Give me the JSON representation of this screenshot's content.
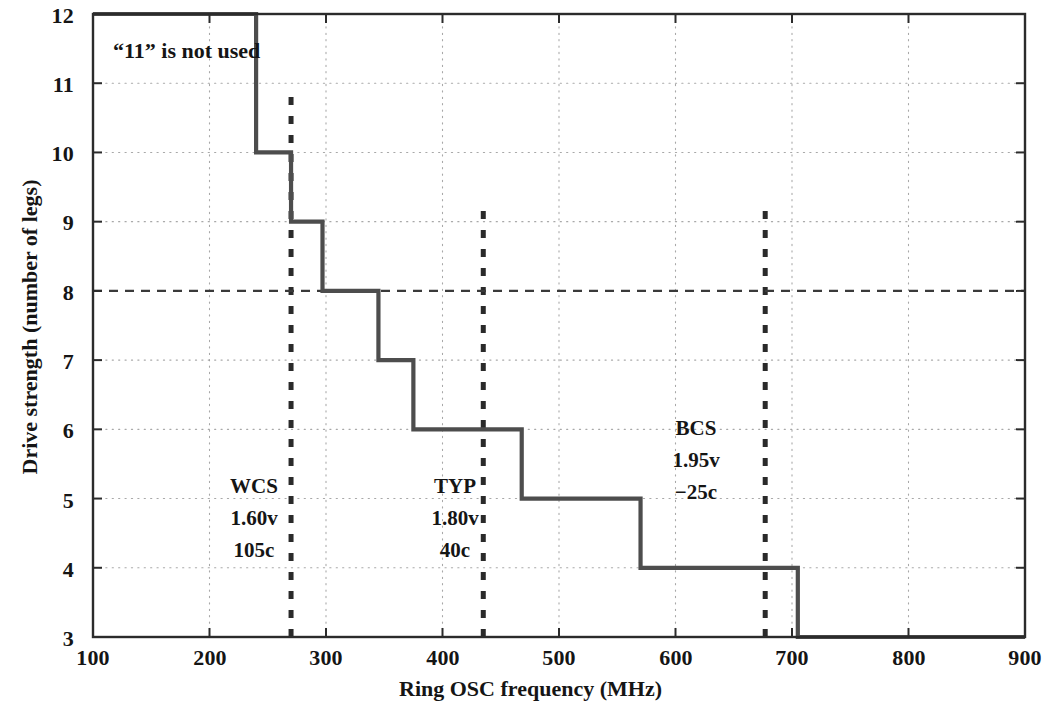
{
  "chart_data": {
    "type": "line",
    "subtype": "step-post",
    "title": "",
    "xlabel": "Ring OSC frequency (MHz)",
    "ylabel": "Drive strength (number of legs)",
    "xlim": [
      100,
      900
    ],
    "ylim": [
      3,
      12
    ],
    "xticks": [
      100,
      200,
      300,
      400,
      500,
      600,
      700,
      800,
      900
    ],
    "yticks": [
      3,
      4,
      5,
      6,
      7,
      8,
      9,
      10,
      11,
      12
    ],
    "grid": "dotted-both",
    "legend": "none",
    "series": [
      {
        "name": "Drive strength selection",
        "color": "#4d4d4d",
        "x": [
          100,
          240,
          240,
          270,
          270,
          297,
          297,
          345,
          345,
          375,
          375,
          468,
          468,
          570,
          570,
          705,
          705,
          900
        ],
        "y": [
          12,
          12,
          10,
          10,
          9,
          9,
          8,
          8,
          7,
          7,
          6,
          6,
          5,
          5,
          4,
          4,
          3,
          3
        ],
        "steps": [
          {
            "frequency_mhz": 240,
            "from_legs": 12,
            "to_legs": 10
          },
          {
            "frequency_mhz": 270,
            "from_legs": 10,
            "to_legs": 9
          },
          {
            "frequency_mhz": 297,
            "from_legs": 9,
            "to_legs": 8
          },
          {
            "frequency_mhz": 345,
            "from_legs": 8,
            "to_legs": 7
          },
          {
            "frequency_mhz": 375,
            "from_legs": 7,
            "to_legs": 6
          },
          {
            "frequency_mhz": 468,
            "from_legs": 6,
            "to_legs": 5
          },
          {
            "frequency_mhz": 570,
            "from_legs": 5,
            "to_legs": 4
          },
          {
            "frequency_mhz": 705,
            "from_legs": 4,
            "to_legs": 3
          }
        ]
      }
    ],
    "reference_lines": [
      {
        "name": "WCS",
        "orientation": "vertical",
        "x": 270,
        "y_from": 3.0,
        "y_to": 10.85,
        "style": "dashed",
        "color": "#2a2a2a"
      },
      {
        "name": "TYP",
        "orientation": "vertical",
        "x": 435,
        "y_from": 3.0,
        "y_to": 9.3,
        "style": "dashed",
        "color": "#2a2a2a"
      },
      {
        "name": "BCS",
        "orientation": "vertical",
        "x": 677,
        "y_from": 3.0,
        "y_to": 9.3,
        "style": "dashed",
        "color": "#2a2a2a"
      },
      {
        "name": "legs-8-highlight",
        "orientation": "horizontal",
        "y": 8,
        "x_from": 100,
        "x_to": 900,
        "style": "dashed",
        "color": "#3a3a3a"
      }
    ],
    "annotations": [
      {
        "name": "note-11-not-used",
        "text": "“11” is not used",
        "x": 130,
        "y": 11.55
      },
      {
        "name": "wcs-corner",
        "lines": [
          "WCS",
          "1.60v",
          "105c"
        ],
        "x": 236,
        "y": 5.1
      },
      {
        "name": "typ-corner",
        "lines": [
          "TYP",
          "1.80v",
          "40c"
        ],
        "x": 400,
        "y": 5.1
      },
      {
        "name": "bcs-corner",
        "lines": [
          "BCS",
          "1.95v",
          "-25c"
        ],
        "x": 640,
        "y": 6.15
      }
    ]
  },
  "axes": {
    "y_tick_labels": [
      "12",
      "11",
      "10",
      "9",
      "8",
      "7",
      "6",
      "5",
      "4",
      "3"
    ],
    "x_tick_labels": [
      "100",
      "200",
      "300",
      "400",
      "500",
      "600",
      "700",
      "800",
      "900"
    ],
    "x_title": "Ring OSC frequency (MHz)",
    "y_title": "Drive strength (number of legs)"
  },
  "notes": {
    "eleven_not_used": "“11” is not used"
  },
  "corners": {
    "wcs": {
      "name": "WCS",
      "voltage": "1.60v",
      "temperature": "105c"
    },
    "typ": {
      "name": "TYP",
      "voltage": "1.80v",
      "temperature": "40c"
    },
    "bcs": {
      "name": "BCS",
      "voltage": "1.95v",
      "temperature": "−25c"
    }
  },
  "colors": {
    "background": "#ffffff",
    "axis": "#2b2b2b",
    "curve": "#4d4d4d",
    "grid": "#9a9a9a",
    "marker": "#2a2a2a",
    "text": "#151515"
  }
}
